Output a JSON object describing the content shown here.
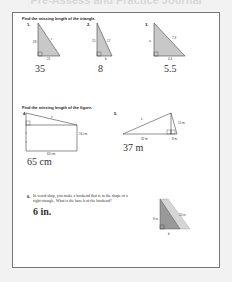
{
  "page_title": "Pre-Assess and Practice Journal",
  "section1": {
    "instruction": "Find the missing length of the triangle.",
    "problems": [
      {
        "number": "1.",
        "labels": {
          "leg_vertical": "28",
          "leg_horizontal": "21",
          "hypotenuse": "c"
        },
        "answer": "35"
      },
      {
        "number": "2.",
        "labels": {
          "leg_vertical": "15",
          "leg_horizontal": "b",
          "hypotenuse": "17"
        },
        "answer": "8"
      },
      {
        "number": "3.",
        "labels": {
          "leg_vertical": "a",
          "leg_horizontal": "4.4",
          "hypotenuse": "7.3"
        },
        "answer": "5.5"
      }
    ]
  },
  "section2": {
    "instruction": "Find the missing length of the figure.",
    "problems": [
      {
        "number": "4.",
        "labels": {
          "side": "16 cm",
          "base": "63 cm",
          "hypotenuse": "x"
        },
        "answer": "65 cm"
      },
      {
        "number": "5.",
        "labels": {
          "height": "15 m",
          "base_left": "32 m",
          "base_right": "8 m",
          "hypotenuse": "x"
        },
        "answer": "37 m"
      }
    ]
  },
  "section3": {
    "problems": [
      {
        "number": "6.",
        "text": "In wood shop, you make a bookend that is in the shape of a right triangle. What is the base b of the bookend?",
        "labels": {
          "height": "8 in.",
          "hypotenuse": "10 in.",
          "base": "b"
        },
        "answer": "6 in."
      }
    ]
  }
}
